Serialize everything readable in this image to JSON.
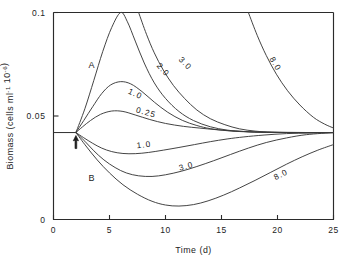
{
  "chart_data": {
    "type": "line",
    "title": "",
    "xlabel": "Time (d)",
    "ylabel": "Biomass (cells ml⁻¹ 10⁻⁶)",
    "xlim": [
      0,
      25
    ],
    "ylim": [
      0,
      0.1
    ],
    "grid": false,
    "legend_position": "inline-curve-labels",
    "x_ticks": [
      "0",
      "5",
      "10",
      "15",
      "20",
      "25"
    ],
    "x_tick_values": [
      0,
      5,
      10,
      15,
      20,
      25
    ],
    "y_ticks": [
      "0",
      "0.05",
      "0.1"
    ],
    "y_tick_values": [
      0,
      0.05,
      0.1
    ],
    "steady_state_biomass": 0.042,
    "perturbation_time": 2,
    "region_labels": [
      {
        "name": "region-a",
        "text": "A",
        "x": 3.4,
        "y": 0.073
      },
      {
        "name": "region-b",
        "text": "B",
        "x": 3.4,
        "y": 0.0185
      }
    ],
    "annotations": [
      {
        "name": "perturbation-arrow",
        "symbol": "up-arrow",
        "x": 2,
        "y": 0.042
      }
    ],
    "series": [
      {
        "name": "0.25",
        "label": "0.25",
        "branch": "A",
        "label_x": 8.2,
        "label_y": 0.0505,
        "points": [
          [
            2,
            0.042
          ],
          [
            2.6,
            0.0448
          ],
          [
            3.3,
            0.0478
          ],
          [
            4.2,
            0.0508
          ],
          [
            5.2,
            0.0524
          ],
          [
            6.2,
            0.0522
          ],
          [
            7.3,
            0.0505
          ],
          [
            8.6,
            0.0483
          ],
          [
            10,
            0.0464
          ],
          [
            11.6,
            0.045
          ],
          [
            13,
            0.0442
          ],
          [
            14.5,
            0.0434
          ],
          [
            16,
            0.0428
          ],
          [
            17.5,
            0.0424
          ],
          [
            19,
            0.0422
          ],
          [
            21,
            0.0421
          ],
          [
            23,
            0.042
          ],
          [
            25,
            0.042
          ]
        ]
      },
      {
        "name": "1.0A",
        "label": "1.0",
        "branch": "A",
        "label_x": 7.2,
        "label_y": 0.0595,
        "points": [
          [
            2,
            0.042
          ],
          [
            2.7,
            0.0478
          ],
          [
            3.5,
            0.0545
          ],
          [
            4.3,
            0.0608
          ],
          [
            5.1,
            0.065
          ],
          [
            6,
            0.0666
          ],
          [
            6.9,
            0.0655
          ],
          [
            7.9,
            0.0618
          ],
          [
            9,
            0.0567
          ],
          [
            10.2,
            0.0518
          ],
          [
            11.5,
            0.0479
          ],
          [
            12.8,
            0.0454
          ],
          [
            14,
            0.0439
          ],
          [
            15.5,
            0.0429
          ],
          [
            17,
            0.0424
          ],
          [
            19,
            0.0421
          ],
          [
            21.5,
            0.042
          ],
          [
            25,
            0.042
          ]
        ]
      },
      {
        "name": "2.0",
        "label": "2.0",
        "branch": "A",
        "label_x": 9.6,
        "label_y": 0.0715,
        "points": [
          [
            2,
            0.042
          ],
          [
            2.8,
            0.0535
          ],
          [
            3.6,
            0.0672
          ],
          [
            4.4,
            0.0812
          ],
          [
            5.2,
            0.0928
          ],
          [
            6,
            0.1
          ],
          [
            6.6,
            0.0955
          ],
          [
            7.3,
            0.0862
          ],
          [
            8.1,
            0.0756
          ],
          [
            9,
            0.066
          ],
          [
            10,
            0.0585
          ],
          [
            11.2,
            0.0522
          ],
          [
            12.5,
            0.0478
          ],
          [
            14,
            0.0448
          ],
          [
            15.5,
            0.0432
          ],
          [
            17,
            0.0425
          ],
          [
            19,
            0.0421
          ],
          [
            22,
            0.042
          ],
          [
            25,
            0.042
          ]
        ]
      },
      {
        "name": "3.0",
        "label": "3.0",
        "branch": "A",
        "label_x": 11.6,
        "label_y": 0.0745,
        "points": [
          [
            7.6,
            0.1
          ],
          [
            8.3,
            0.0895
          ],
          [
            9,
            0.0805
          ],
          [
            9.8,
            0.0722
          ],
          [
            10.7,
            0.0648
          ],
          [
            11.7,
            0.0585
          ],
          [
            12.8,
            0.0529
          ],
          [
            14,
            0.0487
          ],
          [
            15.3,
            0.0458
          ],
          [
            16.6,
            0.0438
          ],
          [
            18,
            0.0427
          ],
          [
            19.5,
            0.0422
          ],
          [
            21.5,
            0.042
          ],
          [
            25,
            0.042
          ]
        ]
      },
      {
        "name": "8.0A",
        "label": "8.0",
        "branch": "A",
        "label_x": 19.6,
        "label_y": 0.0745,
        "points": [
          [
            17.4,
            0.1
          ],
          [
            18.2,
            0.0888
          ],
          [
            19,
            0.0792
          ],
          [
            19.9,
            0.0702
          ],
          [
            20.9,
            0.0622
          ],
          [
            22,
            0.0553
          ],
          [
            23.2,
            0.0494
          ],
          [
            24.2,
            0.0461
          ],
          [
            25,
            0.0442
          ]
        ]
      },
      {
        "name": "1.0B",
        "label": "1.0",
        "branch": "B",
        "label_x": 8.1,
        "label_y": 0.0348,
        "points": [
          [
            2,
            0.042
          ],
          [
            2.7,
            0.0395
          ],
          [
            3.5,
            0.0368
          ],
          [
            4.3,
            0.0345
          ],
          [
            5.2,
            0.0328
          ],
          [
            6.2,
            0.0319
          ],
          [
            7.3,
            0.0318
          ],
          [
            8.5,
            0.0324
          ],
          [
            9.8,
            0.0335
          ],
          [
            11.2,
            0.0348
          ],
          [
            12.6,
            0.0362
          ],
          [
            14,
            0.0376
          ],
          [
            15.5,
            0.0389
          ],
          [
            17,
            0.0399
          ],
          [
            18.8,
            0.0408
          ],
          [
            20.8,
            0.0415
          ],
          [
            23,
            0.0418
          ],
          [
            25,
            0.042
          ]
        ]
      },
      {
        "name": "3.0B",
        "label": "3.0",
        "branch": "B",
        "label_x": 11.9,
        "label_y": 0.0245,
        "points": [
          [
            2,
            0.042
          ],
          [
            2.8,
            0.0378
          ],
          [
            3.6,
            0.0332
          ],
          [
            4.5,
            0.0288
          ],
          [
            5.5,
            0.0251
          ],
          [
            6.5,
            0.0225
          ],
          [
            7.6,
            0.0211
          ],
          [
            8.8,
            0.0208
          ],
          [
            10,
            0.0216
          ],
          [
            11.4,
            0.0233
          ],
          [
            12.8,
            0.0256
          ],
          [
            14.3,
            0.0284
          ],
          [
            15.8,
            0.0314
          ],
          [
            17.4,
            0.0345
          ],
          [
            19,
            0.0372
          ],
          [
            20.8,
            0.0394
          ],
          [
            22.6,
            0.041
          ],
          [
            25,
            0.042
          ]
        ]
      },
      {
        "name": "8.0B",
        "label": "8.0",
        "branch": "B",
        "label_x": 20.4,
        "label_y": 0.0205,
        "points": [
          [
            2,
            0.042
          ],
          [
            2.9,
            0.0355
          ],
          [
            3.9,
            0.0288
          ],
          [
            5,
            0.0225
          ],
          [
            6.2,
            0.0168
          ],
          [
            7.5,
            0.0122
          ],
          [
            8.8,
            0.0088
          ],
          [
            10,
            0.007
          ],
          [
            11.2,
            0.0065
          ],
          [
            12.5,
            0.0072
          ],
          [
            13.8,
            0.009
          ],
          [
            15.2,
            0.0118
          ],
          [
            16.6,
            0.0152
          ],
          [
            18,
            0.0189
          ],
          [
            19.4,
            0.0228
          ],
          [
            20.8,
            0.0267
          ],
          [
            22.2,
            0.0303
          ],
          [
            23.6,
            0.0335
          ],
          [
            25,
            0.0362
          ]
        ]
      }
    ]
  }
}
